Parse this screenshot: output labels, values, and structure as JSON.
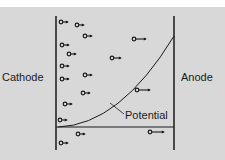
{
  "diagram": {
    "labels": {
      "cathode": "Cathode",
      "anode": "Anode",
      "potential": "Potential"
    },
    "colors": {
      "background": "#d8d8d8",
      "top_strip": "#ffffff",
      "ink": "#1a1a1a"
    },
    "electrodes": {
      "cathode_x": 56,
      "anode_x": 174,
      "top_y": 16,
      "bottom_y": 150
    },
    "baseline_y": 127,
    "potential_curve": {
      "start": [
        58,
        127
      ],
      "control": [
        120,
        125
      ],
      "end": [
        174,
        36
      ]
    },
    "potential_leader": {
      "from": [
        124,
        114
      ],
      "to": [
        110,
        103
      ]
    },
    "electrons": [
      {
        "x": 61,
        "y": 22,
        "tail": 5
      },
      {
        "x": 77,
        "y": 25,
        "tail": 5
      },
      {
        "x": 85,
        "y": 36,
        "tail": 5
      },
      {
        "x": 62,
        "y": 45,
        "tail": 5
      },
      {
        "x": 69,
        "y": 54,
        "tail": 5
      },
      {
        "x": 62,
        "y": 66,
        "tail": 5
      },
      {
        "x": 62,
        "y": 79,
        "tail": 5
      },
      {
        "x": 85,
        "y": 75,
        "tail": 5
      },
      {
        "x": 83,
        "y": 93,
        "tail": 5
      },
      {
        "x": 65,
        "y": 104,
        "tail": 5
      },
      {
        "x": 60,
        "y": 120,
        "tail": 5
      },
      {
        "x": 78,
        "y": 134,
        "tail": 5
      },
      {
        "x": 61,
        "y": 143,
        "tail": 5
      },
      {
        "x": 112,
        "y": 58,
        "tail": 7
      },
      {
        "x": 134,
        "y": 39,
        "tail": 10
      },
      {
        "x": 137,
        "y": 90,
        "tail": 11
      },
      {
        "x": 150,
        "y": 132,
        "tail": 12
      }
    ]
  }
}
